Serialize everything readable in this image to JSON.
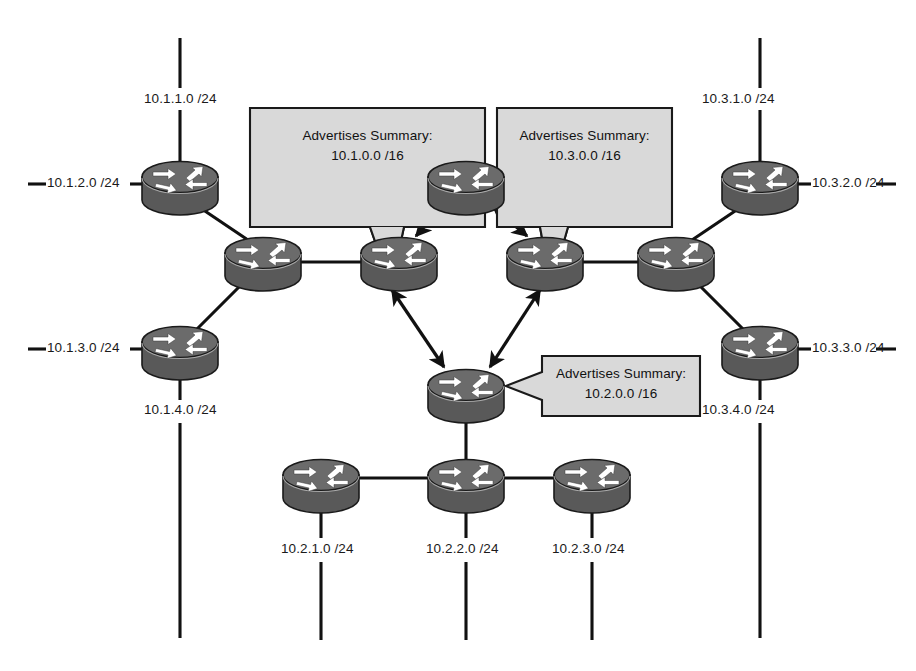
{
  "diagram": {
    "type": "network-topology",
    "colors": {
      "router_body": "#595959",
      "router_top": "#6b6b6b",
      "router_outline": "#1a1a1a",
      "arrow_glyph": "#ffffff",
      "link": "#111111",
      "callout_fill": "#d9d9d9",
      "callout_border": "#1a1a1a",
      "text": "#1a1a1a",
      "background": "#ffffff"
    }
  },
  "callouts": [
    {
      "id": "callout-area1",
      "line1": "Advertises Summary:",
      "line2": "10.1.0.0 /16",
      "points_to": "area1-abr-router"
    },
    {
      "id": "callout-area3",
      "line1": "Advertises Summary:",
      "line2": "10.3.0.0 /16",
      "points_to": "area3-abr-router"
    },
    {
      "id": "callout-area2",
      "line1": "Advertises Summary:",
      "line2": "10.2.0.0 /16",
      "points_to": "area2-abr-router"
    }
  ],
  "subnet_labels": [
    {
      "id": "label-10-1-1-0",
      "text": "10.1.1.0 /24",
      "area": "area1"
    },
    {
      "id": "label-10-1-2-0",
      "text": "10.1.2.0 /24",
      "area": "area1"
    },
    {
      "id": "label-10-1-3-0",
      "text": "10.1.3.0 /24",
      "area": "area1"
    },
    {
      "id": "label-10-1-4-0",
      "text": "10.1.4.0 /24",
      "area": "area1"
    },
    {
      "id": "label-10-3-1-0",
      "text": "10.3.1.0 /24",
      "area": "area3"
    },
    {
      "id": "label-10-3-2-0",
      "text": "10.3.2.0 /24",
      "area": "area3"
    },
    {
      "id": "label-10-3-3-0",
      "text": "10.3.3.0 /24",
      "area": "area3"
    },
    {
      "id": "label-10-3-4-0",
      "text": "10.3.4.0 /24",
      "area": "area3"
    },
    {
      "id": "label-10-2-1-0",
      "text": "10.2.1.0 /24",
      "area": "area2"
    },
    {
      "id": "label-10-2-2-0",
      "text": "10.2.2.0 /24",
      "area": "area2"
    },
    {
      "id": "label-10-2-3-0",
      "text": "10.2.3.0 /24",
      "area": "area2"
    }
  ],
  "routers": [
    {
      "id": "area1-router-top",
      "cx": 180,
      "cy": 183
    },
    {
      "id": "area1-router-mid",
      "cx": 263,
      "cy": 259
    },
    {
      "id": "area1-router-bottom",
      "cx": 180,
      "cy": 348
    },
    {
      "id": "area1-abr-router",
      "cx": 399,
      "cy": 259
    },
    {
      "id": "backbone-core-router",
      "cx": 466,
      "cy": 183
    },
    {
      "id": "area3-abr-router",
      "cx": 545,
      "cy": 259
    },
    {
      "id": "area3-router-mid",
      "cx": 676,
      "cy": 259
    },
    {
      "id": "area3-router-top",
      "cx": 760,
      "cy": 183
    },
    {
      "id": "area3-router-bottom",
      "cx": 760,
      "cy": 348
    },
    {
      "id": "area2-abr-router",
      "cx": 466,
      "cy": 391
    },
    {
      "id": "area2-router-left",
      "cx": 321,
      "cy": 481
    },
    {
      "id": "area2-router-center",
      "cx": 466,
      "cy": 481
    },
    {
      "id": "area2-router-right",
      "cx": 592,
      "cy": 481
    }
  ]
}
